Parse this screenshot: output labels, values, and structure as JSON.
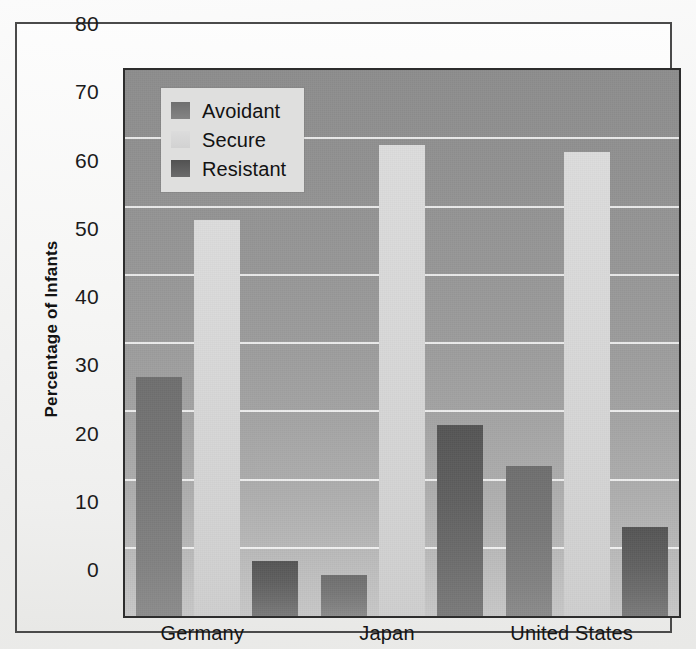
{
  "chart_data": {
    "type": "bar",
    "title": "",
    "xlabel": "",
    "ylabel": "Percentage of Infants",
    "categories": [
      "Germany",
      "Japan",
      "United States"
    ],
    "series": [
      {
        "name": "Avoidant",
        "values": [
          35,
          6,
          22
        ]
      },
      {
        "name": "Secure",
        "values": [
          58,
          69,
          68
        ]
      },
      {
        "name": "Resistant",
        "values": [
          8,
          28,
          13
        ]
      }
    ],
    "ylim": [
      0,
      80
    ],
    "yticks": [
      0,
      10,
      20,
      30,
      40,
      50,
      60,
      70,
      80
    ],
    "ytick_labels": [
      "0",
      "10",
      "20",
      "30",
      "40",
      "50",
      "60",
      "70",
      "80"
    ],
    "grid": true,
    "legend_position": "top-left",
    "colors": {
      "avoidant": "#787878",
      "secure": "#d6d6d6",
      "resistant": "#616161",
      "plot_background": "#9c9c9c",
      "gridline": "#ffffff",
      "axis": "#2d2d2d",
      "text": "#151515"
    }
  },
  "legend": {
    "items": [
      {
        "label": "Avoidant",
        "swatch": "avoidant"
      },
      {
        "label": "Secure",
        "swatch": "secure"
      },
      {
        "label": "Resistant",
        "swatch": "resistant"
      }
    ]
  }
}
